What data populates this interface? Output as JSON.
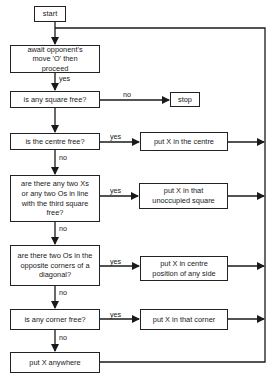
{
  "flowchart": {
    "start": "start",
    "await": "await opponent's move 'O' then proceed",
    "square_free": "is any square free?",
    "stop": "stop",
    "centre_free": "is the centre free?",
    "put_centre": "put X  in the centre",
    "two_in_line": "are there any two Xs or any two Os in line with the third square free?",
    "put_unoccupied": "put X in that unoccupied square",
    "two_os_diagonal": "are there two Os in the opposite corners of a diagonal?",
    "put_side": "put X in centre position of any side",
    "corner_free": "is any corner free?",
    "put_corner": "put X in that corner",
    "put_anywhere": "put X anywhere"
  },
  "labels": {
    "yes": "yes",
    "no": "no"
  },
  "colors": {
    "line": "#1a1a1a",
    "background": "#ffffff"
  }
}
